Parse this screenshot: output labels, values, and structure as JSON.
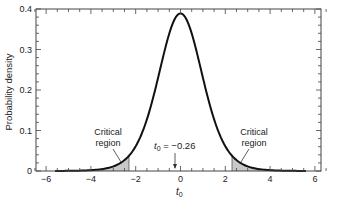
{
  "chart_data": {
    "type": "line",
    "title": "",
    "xlabel": "t0",
    "ylabel": "Probability density",
    "xlim": [
      -6.5,
      6.5
    ],
    "ylim": [
      0,
      0.4
    ],
    "x_ticks": [
      -6,
      -4,
      -2,
      0,
      2,
      4,
      6
    ],
    "x_tick_labels": [
      "−6",
      "−4",
      "−2",
      "0",
      "2",
      "4",
      "6"
    ],
    "y_ticks": [
      0,
      0.1,
      0.2,
      0.3,
      0.4
    ],
    "y_tick_labels": [
      "0",
      "0.1",
      "0.2",
      "0.3",
      "0.4"
    ],
    "grid": false,
    "legend": null,
    "series": [
      {
        "name": "t distribution density",
        "x_range": [
          -5.6,
          5.6
        ],
        "peak": {
          "x": 0,
          "y": 0.39
        },
        "shape": "bell (Student t)"
      }
    ],
    "shaded_regions": [
      {
        "name": "left critical region",
        "x_from": -5.6,
        "x_to": -2.3
      },
      {
        "name": "right critical region",
        "x_from": 2.3,
        "x_to": 5.6
      }
    ],
    "annotations": [
      {
        "text": "Critical\nregion",
        "points_to_x": -2.6
      },
      {
        "text": "Critical\nregion",
        "points_to_x": 2.6
      },
      {
        "text": "t0 = −0.26",
        "points_to_x": -0.26
      }
    ]
  },
  "labels": {
    "ylabel": "Probability density",
    "xlabel_main": "t",
    "xlabel_sub": "0",
    "critical_left_1": "Critical",
    "critical_left_2": "region",
    "critical_right_1": "Critical",
    "critical_right_2": "region",
    "t0_main": "t",
    "t0_sub": "0",
    "t0_value": " = −0.26"
  }
}
